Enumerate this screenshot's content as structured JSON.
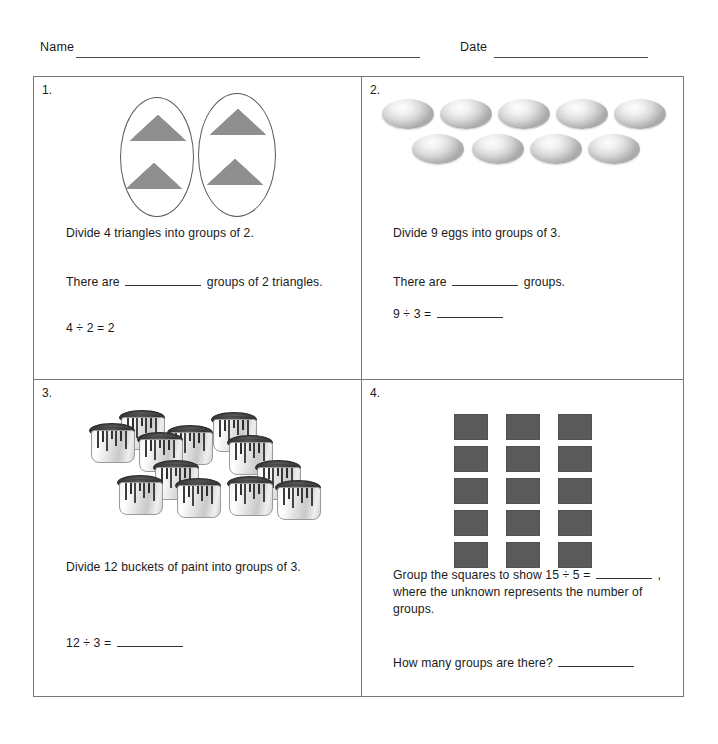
{
  "header": {
    "name_label": "Name",
    "date_label": "Date"
  },
  "watermark": "",
  "problems": [
    {
      "number": "1.",
      "illustration": "two-ovals-each-with-two-triangles",
      "prompt": "Divide 4 triangles into groups of 2.",
      "sentence_pre": "There are",
      "sentence_post": "groups of 2 triangles.",
      "equation": "4 ÷ 2 = 2"
    },
    {
      "number": "2.",
      "illustration": "nine-eggs-five-over-four",
      "prompt": "Divide 9 eggs into groups of 3.",
      "sentence_pre": "There are",
      "sentence_post": "groups.",
      "equation_pre": "9 ÷ 3 ="
    },
    {
      "number": "3.",
      "illustration": "twelve-paint-buckets",
      "prompt": "Divide 12 buckets of paint into groups of 3.",
      "equation_pre": "12 ÷ 3 ="
    },
    {
      "number": "4.",
      "illustration": "fifteen-squares-three-columns-five-rows",
      "prompt_part1": "Group the squares to show 15 ÷ 5 =",
      "prompt_part2": ", where the unknown represents the number of groups.",
      "question": "How many groups are there?"
    }
  ],
  "colors": {
    "border": "#777777",
    "triangle_fill": "#b8b8b8",
    "square_fill": "#5a5a5a",
    "egg_fill": "#e0e0e0",
    "text": "#1a1a1a"
  }
}
